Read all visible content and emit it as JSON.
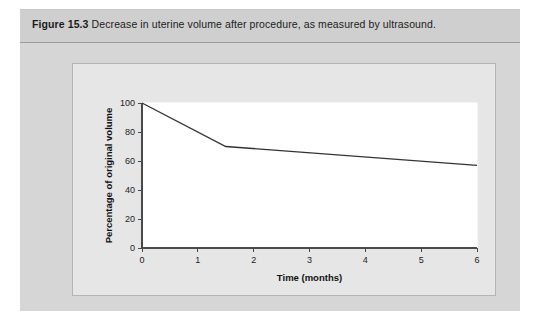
{
  "figure": {
    "label": "Figure 15.3",
    "caption": "Decrease in uterine volume after procedure, as measured by ultrasound."
  },
  "colors": {
    "page_background": "#ffffff",
    "figure_box": "#d6d6d6",
    "caption_band": "#cfcfcf",
    "chart_panel": "#e6e6e6",
    "plot_area": "#ffffff",
    "line": "#333333",
    "axis": "#4a4a4a",
    "text": "#1b1b1b"
  },
  "chart_data": {
    "type": "line",
    "title": "",
    "xlabel": "Time (months)",
    "ylabel": "Percentage of original volume",
    "xlim": [
      0,
      6
    ],
    "ylim": [
      0,
      100
    ],
    "xticks": [
      0,
      1,
      2,
      3,
      4,
      5,
      6
    ],
    "xtick_labels": [
      "0",
      "1",
      "2",
      "3",
      "4",
      "5",
      "6"
    ],
    "yticks": [
      0,
      20,
      40,
      60,
      80,
      100
    ],
    "ytick_labels": [
      "0",
      "20",
      "40",
      "60",
      "80",
      "100"
    ],
    "grid": false,
    "legend": false,
    "series": [
      {
        "name": "Uterine volume",
        "x": [
          0,
          1.5,
          6
        ],
        "y": [
          100,
          70,
          57
        ]
      }
    ]
  }
}
